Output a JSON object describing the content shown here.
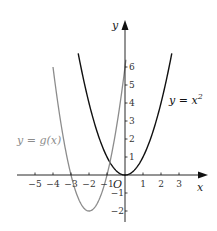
{
  "chart_data": {
    "type": "line",
    "title": "",
    "xlabel": "x",
    "ylabel": "y",
    "origin_label": "O",
    "xlim": [
      -5.5,
      4
    ],
    "ylim": [
      -2.5,
      7.5
    ],
    "grid": false,
    "x_ticks": [
      -5,
      -4,
      -3,
      -2,
      -1,
      1,
      2,
      3
    ],
    "x_tick_labels": [
      "−5",
      "−4",
      "−3",
      "−2",
      "−1",
      "1",
      "2",
      "3"
    ],
    "y_ticks": [
      -2,
      -1,
      1,
      2,
      3,
      4,
      5,
      6
    ],
    "y_tick_labels": [
      "−2",
      "−1",
      "1",
      "2",
      "3",
      "4",
      "5",
      "6"
    ],
    "series": [
      {
        "name": "y = x²",
        "label": "y = x",
        "label_sup": "2",
        "color": "#111111",
        "expression": "x^2",
        "x_range": [
          -2.6,
          2.6
        ],
        "points": [
          [
            -2.6,
            6.76
          ],
          [
            -2,
            4
          ],
          [
            -1,
            1
          ],
          [
            0,
            0
          ],
          [
            1,
            1
          ],
          [
            2,
            4
          ],
          [
            2.6,
            6.76
          ]
        ]
      },
      {
        "name": "y = g(x)",
        "label": "y = g(x)",
        "color": "#8c8c8c",
        "expression": "2(x+2)^2 - 2",
        "x_range": [
          -4.0,
          0.05
        ],
        "points": [
          [
            -4,
            6
          ],
          [
            -3,
            0
          ],
          [
            -2,
            -2
          ],
          [
            -1,
            0
          ],
          [
            0,
            6
          ]
        ]
      }
    ]
  },
  "colors": {
    "axis": "#111111",
    "x_squared_curve": "#111111",
    "g_curve": "#8c8c8c"
  }
}
